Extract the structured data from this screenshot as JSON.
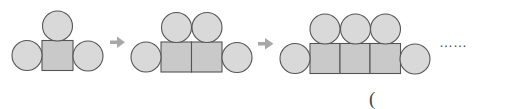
{
  "diagram": {
    "figures": [
      {
        "index": 1,
        "squares": 1,
        "circles": 3
      },
      {
        "index": 2,
        "squares": 2,
        "circles": 4
      },
      {
        "index": 3,
        "squares": 3,
        "circles": 5
      }
    ],
    "continuation": "……",
    "answer_bracket": "(",
    "colors": {
      "circle_fill": "#d9d9d9",
      "square_fill": "#c9c9c9",
      "stroke": "#555555",
      "arrow": "#a8a8a8"
    }
  }
}
